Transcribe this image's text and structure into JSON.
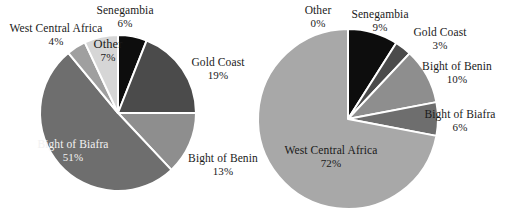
{
  "figure": {
    "background_color": "#ffffff",
    "text_color": "#1a1a1a",
    "slice_border_color": "#ffffff"
  },
  "chart_data": [
    {
      "type": "pie",
      "title": "",
      "chart_id": "left-pie",
      "legend_position": "outside-labels",
      "center": {
        "x": 118,
        "y": 113
      },
      "radius": 78,
      "start_angle_deg": -90,
      "direction": "clockwise",
      "categories": [
        "Senegambia",
        "Gold Coast",
        "Bight of Benin",
        "Bight of Biafra",
        "West Central Africa",
        "Other"
      ],
      "values": [
        6,
        19,
        13,
        51,
        4,
        7
      ],
      "unit": "%",
      "colors": [
        "#0d0d0d",
        "#4b4b4b",
        "#8e8e8e",
        "#6e6e6e",
        "#9f9f9f",
        "#d6d6d6"
      ],
      "slices": [
        {
          "label": "Senegambia",
          "value": 6,
          "display": "6%",
          "color": "#0d0d0d"
        },
        {
          "label": "Gold Coast",
          "value": 19,
          "display": "19%",
          "color": "#4b4b4b"
        },
        {
          "label": "Bight of Benin",
          "value": 13,
          "display": "13%",
          "color": "#8e8e8e"
        },
        {
          "label": "Bight of Biafra",
          "value": 51,
          "display": "51%",
          "color": "#6e6e6e"
        },
        {
          "label": "West Central Africa",
          "value": 4,
          "display": "4%",
          "color": "#9f9f9f"
        },
        {
          "label": "Other",
          "value": 7,
          "display": "7%",
          "color": "#d6d6d6"
        }
      ]
    },
    {
      "type": "pie",
      "title": "",
      "chart_id": "right-pie",
      "legend_position": "outside-labels",
      "center": {
        "x": 348,
        "y": 119
      },
      "radius": 90,
      "start_angle_deg": -90,
      "direction": "clockwise",
      "categories": [
        "Other",
        "Senegambia",
        "Gold Coast",
        "Bight of Benin",
        "Bight of Biafra",
        "West Central Africa"
      ],
      "values": [
        0,
        9,
        3,
        10,
        6,
        72
      ],
      "unit": "%",
      "colors": [
        "#d6d6d6",
        "#0d0d0d",
        "#4b4b4b",
        "#8e8e8e",
        "#6e6e6e",
        "#a8a8a8"
      ],
      "slices": [
        {
          "label": "Other",
          "value": 0,
          "display": "0%",
          "color": "#d6d6d6"
        },
        {
          "label": "Senegambia",
          "value": 9,
          "display": "9%",
          "color": "#0d0d0d"
        },
        {
          "label": "Gold Coast",
          "value": 3,
          "display": "3%",
          "color": "#4b4b4b"
        },
        {
          "label": "Bight of Benin",
          "value": 10,
          "display": "10%",
          "color": "#8e8e8e"
        },
        {
          "label": "Bight of Biafra",
          "value": 6,
          "display": "6%",
          "color": "#6e6e6e"
        },
        {
          "label": "West Central Africa",
          "value": 72,
          "display": "72%",
          "color": "#a8a8a8"
        }
      ]
    }
  ],
  "left_labels": {
    "senegambia": {
      "name": "Senegambia",
      "pct": "6%"
    },
    "west_central_africa": {
      "name": "West Central Africa",
      "pct": "4%"
    },
    "other": {
      "name": "Other",
      "pct": "7%"
    },
    "gold_coast": {
      "name": "Gold Coast",
      "pct": "19%"
    },
    "bight_of_benin": {
      "name": "Bight of Benin",
      "pct": "13%"
    },
    "bight_of_biafra": {
      "name": "Bight of Biafra",
      "pct": "51%"
    }
  },
  "right_labels": {
    "other": {
      "name": "Other",
      "pct": "0%"
    },
    "senegambia": {
      "name": "Senegambia",
      "pct": "9%"
    },
    "gold_coast": {
      "name": "Gold Coast",
      "pct": "3%"
    },
    "bight_of_benin": {
      "name": "Bight of Benin",
      "pct": "10%"
    },
    "bight_of_biafra": {
      "name": "Bight of Biafra",
      "pct": "6%"
    },
    "west_central_africa": {
      "name": "West Central Africa",
      "pct": "72%"
    }
  }
}
